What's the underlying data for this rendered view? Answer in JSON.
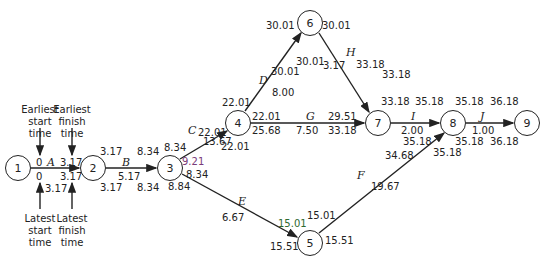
{
  "nodes": [
    {
      "id": "1",
      "x": 18,
      "y": 168
    },
    {
      "id": "2",
      "x": 93,
      "y": 168
    },
    {
      "id": "3",
      "x": 170,
      "y": 168
    },
    {
      "id": "4",
      "x": 238,
      "y": 123
    },
    {
      "id": "5",
      "x": 310,
      "y": 243
    },
    {
      "id": "6",
      "x": 310,
      "y": 23
    },
    {
      "id": "7",
      "x": 378,
      "y": 123
    },
    {
      "id": "8",
      "x": 453,
      "y": 123
    },
    {
      "id": "9",
      "x": 527,
      "y": 123
    }
  ],
  "activities": [
    {
      "name": "A",
      "from": "1",
      "to": "2",
      "duration": "3.17"
    },
    {
      "name": "B",
      "from": "2",
      "to": "3",
      "duration": "5.17"
    },
    {
      "name": "C",
      "from": "3",
      "to": "4",
      "duration": "13.67"
    },
    {
      "name": "D",
      "from": "4",
      "to": "6",
      "duration": "8.00"
    },
    {
      "name": "E",
      "from": "3",
      "to": "5",
      "duration": "6.67"
    },
    {
      "name": "F",
      "from": "5",
      "to": "8",
      "duration": "19.67"
    },
    {
      "name": "G",
      "from": "4",
      "to": "7",
      "duration": "7.50"
    },
    {
      "name": "H",
      "from": "6",
      "to": "7",
      "duration": "3.17"
    },
    {
      "name": "I",
      "from": "7",
      "to": "8",
      "duration": "2.00"
    },
    {
      "name": "J",
      "from": "8",
      "to": "9",
      "duration": "1.00"
    }
  ],
  "labels": {
    "a_es": "0",
    "a_ef": "3.17",
    "a_ls": "0",
    "a_lf": "3.17",
    "a_slack": "3.17",
    "n2_top": "3.17",
    "n2_bot": "3.17",
    "b_ls": "8.34",
    "b_lf": "8.34",
    "b_top": "8.34",
    "n3_c_ls": "8.34",
    "n3_c_es": "9.21",
    "n3_e_es": "8.34",
    "n3_e_ls": "8.84",
    "c_top": "8.34",
    "n4_left": "22.01",
    "n4_top": "22.01",
    "c_lf": "22.01",
    "d_es": "30.01",
    "d_lf": "30.01",
    "n6_left": "30.01",
    "n6_right": "30.01",
    "g_es": "22.01",
    "g_ls": "25.68",
    "g_ef": "29.51",
    "g_lf": "33.18",
    "h_lf": "33.18",
    "n7_top": "33.18",
    "i_ef": "35.18",
    "i_lf": "35.18",
    "i_ls_top": "33.18",
    "n8_top_left": "35.18",
    "n8_top_right": "35.18",
    "j_ef": "36.18",
    "n8_bot_right": "35.18",
    "n9_bot": "36.18",
    "f_lf": "35.18",
    "f_es": "34.68",
    "e_ef": "15.01",
    "n5_left": "15.51",
    "n5_right": "15.51",
    "f_ls": "15.01"
  },
  "annotations": {
    "earliest_start": "Earliest\nstart\ntime",
    "earliest_finish": "Earliest\nfinish\ntime",
    "latest_start": "Latest\nstart\ntime",
    "latest_finish": "Latest\nfinish\ntime"
  }
}
